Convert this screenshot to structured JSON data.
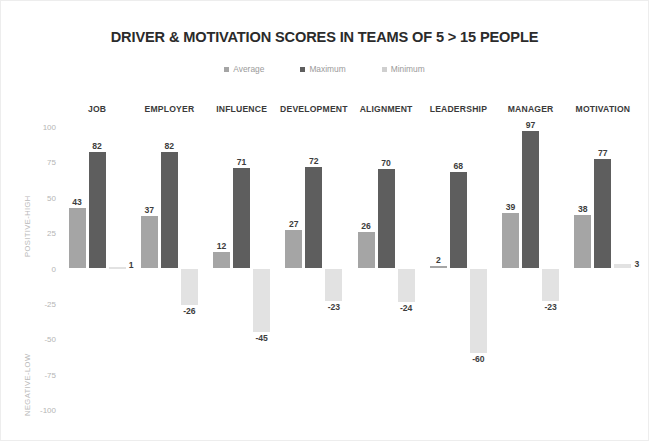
{
  "chart_data": {
    "type": "bar",
    "title": "DRIVER & MOTIVATION SCORES IN TEAMS OF 5 > 15 PEOPLE",
    "xlabel": "",
    "ylabel": "",
    "ylim": [
      -100,
      100
    ],
    "grid": false,
    "legend_position": "top",
    "axis_titles": {
      "positive": "POSITIVE-HIGH",
      "negative": "NEGATIVE-LOW"
    },
    "yticks": [
      "100",
      "75",
      "50",
      "25",
      "0",
      "-25",
      "-50",
      "-75",
      "-100"
    ],
    "ytick_values": [
      100,
      75,
      50,
      25,
      0,
      -25,
      -50,
      -75,
      -100
    ],
    "categories": [
      "JOB",
      "EMPLOYER",
      "INFLUENCE",
      "DEVELOPMENT",
      "ALIGNMENT",
      "LEADERSHIP",
      "MANAGER",
      "MOTIVATION"
    ],
    "series": [
      {
        "name": "Average",
        "color": "#a5a5a5",
        "values": [
          43,
          37,
          12,
          27,
          26,
          2,
          39,
          38
        ]
      },
      {
        "name": "Maximum",
        "color": "#5e5e5e",
        "values": [
          82,
          82,
          71,
          72,
          70,
          68,
          97,
          77
        ]
      },
      {
        "name": "Minimum",
        "color": "#e2e2e2",
        "values": [
          1,
          -26,
          -45,
          -23,
          -24,
          -60,
          -23,
          3
        ]
      }
    ],
    "data_labels": {
      "JOB": {
        "Average": "43",
        "Maximum": "82",
        "Minimum": "1"
      },
      "EMPLOYER": {
        "Average": "37",
        "Maximum": "82",
        "Minimum": "-26"
      },
      "INFLUENCE": {
        "Average": "12",
        "Maximum": "71",
        "Minimum": "-45"
      },
      "DEVELOPMENT": {
        "Average": "27",
        "Maximum": "72",
        "Minimum": "-23"
      },
      "ALIGNMENT": {
        "Average": "26",
        "Maximum": "70",
        "Minimum": "-24"
      },
      "LEADERSHIP": {
        "Average": "2",
        "Maximum": "68",
        "Minimum": "-60"
      },
      "MANAGER": {
        "Average": "39",
        "Maximum": "97",
        "Minimum": "-23"
      },
      "MOTIVATION": {
        "Average": "38",
        "Maximum": "77",
        "Minimum": "3"
      }
    }
  },
  "legend": {
    "items": [
      {
        "label": "Average",
        "color": "#a5a5a5"
      },
      {
        "label": "Maximum",
        "color": "#5e5e5e"
      },
      {
        "label": "Minimum",
        "color": "#cfcfcf"
      }
    ]
  }
}
